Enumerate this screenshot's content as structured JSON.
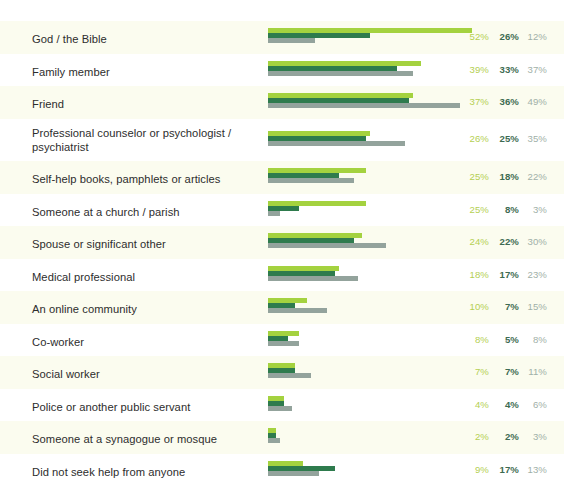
{
  "chart_data": {
    "type": "bar",
    "orientation": "horizontal",
    "title": "",
    "subtitle": "",
    "xlabel": "",
    "ylabel": "",
    "grid": false,
    "legend_position": "none",
    "xlim": [
      0,
      55
    ],
    "value_suffix": "%",
    "colors": {
      "series_1": "#a4d23f",
      "series_2": "#2e7b4d",
      "series_3": "#93a39c",
      "row_stripe": "#fbfcef",
      "background": "#ffffff",
      "label_text": "#2d2d2d",
      "value_1_text": "#b4cf52",
      "value_2_text": "#3d6b52",
      "value_3_text": "#9fb0a8"
    },
    "series": [
      {
        "name": "series-1",
        "values": [
          52,
          39,
          37,
          26,
          25,
          25,
          24,
          18,
          10,
          8,
          7,
          4,
          2,
          9
        ]
      },
      {
        "name": "series-2",
        "values": [
          26,
          33,
          36,
          25,
          18,
          8,
          22,
          17,
          7,
          5,
          7,
          4,
          2,
          17
        ]
      },
      {
        "name": "series-3",
        "values": [
          12,
          37,
          49,
          35,
          22,
          3,
          30,
          23,
          15,
          8,
          11,
          6,
          3,
          13
        ]
      }
    ],
    "categories": [
      "God / the Bible",
      "Family member",
      "Friend",
      "Professional counselor or psychologist / psychiatrist",
      "Self-help books, pamphlets or articles",
      "Someone at a church / parish",
      "Spouse or significant other",
      "Medical professional",
      "An online community",
      "Co-worker",
      "Social worker",
      "Police or another public servant",
      "Someone at a synagogue or mosque",
      "Did not seek help from anyone"
    ],
    "rows": [
      {
        "label": "God / the Bible",
        "values": [
          52,
          26,
          12
        ],
        "display": [
          "52%",
          "26%",
          "12%"
        ]
      },
      {
        "label": "Family member",
        "values": [
          39,
          33,
          37
        ],
        "display": [
          "39%",
          "33%",
          "37%"
        ]
      },
      {
        "label": "Friend",
        "values": [
          37,
          36,
          49
        ],
        "display": [
          "37%",
          "36%",
          "49%"
        ]
      },
      {
        "label": "Professional counselor or psychologist / psychiatrist",
        "values": [
          26,
          25,
          35
        ],
        "display": [
          "26%",
          "25%",
          "35%"
        ]
      },
      {
        "label": "Self-help books, pamphlets or articles",
        "values": [
          25,
          18,
          22
        ],
        "display": [
          "25%",
          "18%",
          "22%"
        ]
      },
      {
        "label": "Someone at a church / parish",
        "values": [
          25,
          8,
          3
        ],
        "display": [
          "25%",
          "8%",
          "3%"
        ]
      },
      {
        "label": "Spouse or significant other",
        "values": [
          24,
          22,
          30
        ],
        "display": [
          "24%",
          "22%",
          "30%"
        ]
      },
      {
        "label": "Medical professional",
        "values": [
          18,
          17,
          23
        ],
        "display": [
          "18%",
          "17%",
          "23%"
        ]
      },
      {
        "label": "An online community",
        "values": [
          10,
          7,
          15
        ],
        "display": [
          "10%",
          "7%",
          "15%"
        ]
      },
      {
        "label": "Co-worker",
        "values": [
          8,
          5,
          8
        ],
        "display": [
          "8%",
          "5%",
          "8%"
        ]
      },
      {
        "label": "Social worker",
        "values": [
          7,
          7,
          11
        ],
        "display": [
          "7%",
          "7%",
          "11%"
        ]
      },
      {
        "label": "Police or another public servant",
        "values": [
          4,
          4,
          6
        ],
        "display": [
          "4%",
          "4%",
          "6%"
        ]
      },
      {
        "label": "Someone at a synagogue or mosque",
        "values": [
          2,
          2,
          3
        ],
        "display": [
          "2%",
          "2%",
          "3%"
        ]
      },
      {
        "label": "Did not seek help from anyone",
        "values": [
          9,
          17,
          13
        ],
        "display": [
          "9%",
          "17%",
          "13%"
        ]
      }
    ]
  }
}
